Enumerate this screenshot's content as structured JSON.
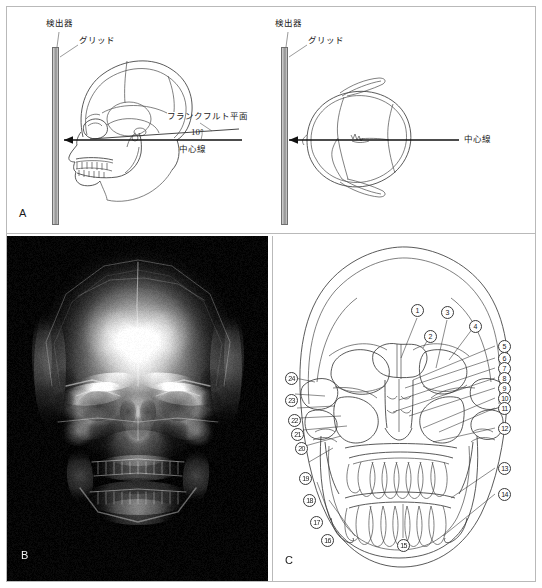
{
  "figure": {
    "panels": [
      {
        "id": "A",
        "letter": "A",
        "type": "positioning-diagram",
        "views": [
          {
            "name": "lateral-view",
            "labels": {
              "detector": "検出器",
              "grid": "グリッド",
              "frankfurt_plane": "フランクフルト平面",
              "angle": "10°",
              "central_ray": "中心線"
            }
          },
          {
            "name": "superior-axial-view",
            "labels": {
              "detector": "検出器",
              "grid": "グリッド",
              "central_ray": "中心線"
            }
          }
        ]
      },
      {
        "id": "B",
        "letter": "B",
        "type": "radiograph",
        "description": "PA skull radiograph"
      },
      {
        "id": "C",
        "letter": "C",
        "type": "line-drawing-key",
        "description": "Anatomical line drawing with numbered structure callouts",
        "callout_numbers": [
          "1",
          "2",
          "3",
          "4",
          "5",
          "6",
          "7",
          "8",
          "9",
          "10",
          "11",
          "12",
          "13",
          "14",
          "15",
          "16",
          "17",
          "18",
          "19",
          "20",
          "21",
          "22",
          "23",
          "24"
        ]
      }
    ]
  },
  "colors": {
    "frame": "#b9b9b9",
    "ink": "#3c3c3c",
    "radiograph_background": "#050505",
    "detector_gray": "#a9a9a9"
  }
}
